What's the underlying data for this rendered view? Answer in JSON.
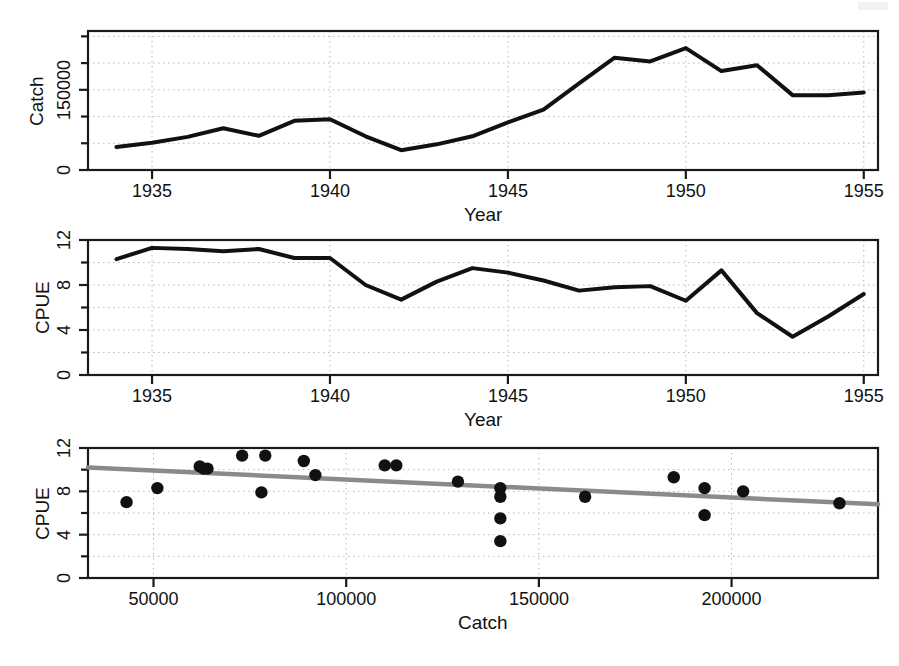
{
  "figure": {
    "background_color": "#ffffff",
    "line_color": "#111111",
    "point_color": "#111111",
    "regression_color": "#8a8a8a",
    "grid_color": "#b9b9b9",
    "frame_color": "#1a1a1a"
  },
  "chart_data": [
    {
      "type": "line",
      "panel": "top",
      "title": "",
      "xlabel": "Year",
      "ylabel": "Catch",
      "xlim": [
        1933.2,
        1955.4
      ],
      "ylim": [
        0,
        260000
      ],
      "xticks": [
        1935,
        1940,
        1945,
        1950,
        1955
      ],
      "xticklabels": [
        "1935",
        "1940",
        "1945",
        "1950",
        "1955"
      ],
      "yticks": [
        0,
        50000,
        100000,
        150000,
        200000,
        250000
      ],
      "yticklabels": [
        "0",
        "",
        "",
        "150000",
        "",
        ""
      ],
      "grid": true,
      "x": [
        1934,
        1935,
        1936,
        1937,
        1938,
        1939,
        1940,
        1941,
        1942,
        1943,
        1944,
        1945,
        1946,
        1947,
        1948,
        1949,
        1950,
        1951,
        1952,
        1953,
        1954,
        1955
      ],
      "values": [
        43000,
        51000,
        62000,
        78000,
        64000,
        92000,
        95000,
        63000,
        37000,
        48000,
        63000,
        89000,
        113000,
        162000,
        210000,
        203000,
        228000,
        185000,
        196000,
        140000,
        140000,
        145000
      ]
    },
    {
      "type": "line",
      "panel": "middle",
      "title": "",
      "xlabel": "Year",
      "ylabel": "CPUE",
      "xlim": [
        1933.2,
        1955.4
      ],
      "ylim": [
        0,
        12
      ],
      "xticks": [
        1935,
        1940,
        1945,
        1950,
        1955
      ],
      "xticklabels": [
        "1935",
        "1940",
        "1945",
        "1950",
        "1955"
      ],
      "yticks": [
        0,
        2,
        4,
        6,
        8,
        10,
        12
      ],
      "yticklabels": [
        "0",
        "",
        "4",
        "",
        "8",
        "",
        "12"
      ],
      "grid": true,
      "x": [
        1934,
        1935,
        1936,
        1937,
        1938,
        1939,
        1940,
        1941,
        1942,
        1943,
        1944,
        1945,
        1946,
        1947,
        1948,
        1949,
        1950,
        1951,
        1952,
        1953,
        1954,
        1955
      ],
      "values": [
        10.3,
        11.3,
        11.2,
        11.0,
        11.2,
        10.4,
        10.4,
        8.0,
        6.7,
        8.3,
        9.5,
        9.1,
        8.4,
        7.5,
        7.8,
        7.9,
        6.6,
        9.3,
        5.5,
        3.4,
        5.2,
        7.2
      ]
    },
    {
      "type": "scatter",
      "panel": "bottom",
      "title": "",
      "xlabel": "Catch",
      "ylabel": "CPUE",
      "xlim": [
        33000,
        238000
      ],
      "ylim": [
        0,
        12
      ],
      "xticks": [
        50000,
        100000,
        150000,
        200000
      ],
      "xticklabels": [
        "50000",
        "100000",
        "150000",
        "200000"
      ],
      "yticks": [
        0,
        2,
        4,
        6,
        8,
        10,
        12
      ],
      "yticklabels": [
        "0",
        "",
        "4",
        "",
        "8",
        "",
        "12"
      ],
      "grid": true,
      "points": [
        {
          "x": 43000,
          "y": 7.0
        },
        {
          "x": 51000,
          "y": 8.3
        },
        {
          "x": 62000,
          "y": 10.3
        },
        {
          "x": 64000,
          "y": 10.1
        },
        {
          "x": 63000,
          "y": 10.1
        },
        {
          "x": 78000,
          "y": 7.9
        },
        {
          "x": 73000,
          "y": 11.3
        },
        {
          "x": 79000,
          "y": 11.3
        },
        {
          "x": 92000,
          "y": 9.5
        },
        {
          "x": 89000,
          "y": 10.8
        },
        {
          "x": 110000,
          "y": 10.4
        },
        {
          "x": 113000,
          "y": 10.4
        },
        {
          "x": 129000,
          "y": 8.9
        },
        {
          "x": 140000,
          "y": 8.3
        },
        {
          "x": 140000,
          "y": 7.5
        },
        {
          "x": 140000,
          "y": 5.5
        },
        {
          "x": 140000,
          "y": 3.4
        },
        {
          "x": 162000,
          "y": 7.5
        },
        {
          "x": 185000,
          "y": 9.3
        },
        {
          "x": 193000,
          "y": 8.3
        },
        {
          "x": 193000,
          "y": 5.8
        },
        {
          "x": 203000,
          "y": 8.0
        },
        {
          "x": 228000,
          "y": 6.9
        }
      ],
      "regression": {
        "name": "linear-fit",
        "x_start": 33000,
        "y_start": 10.2,
        "x_end": 238000,
        "y_end": 6.8
      }
    }
  ]
}
